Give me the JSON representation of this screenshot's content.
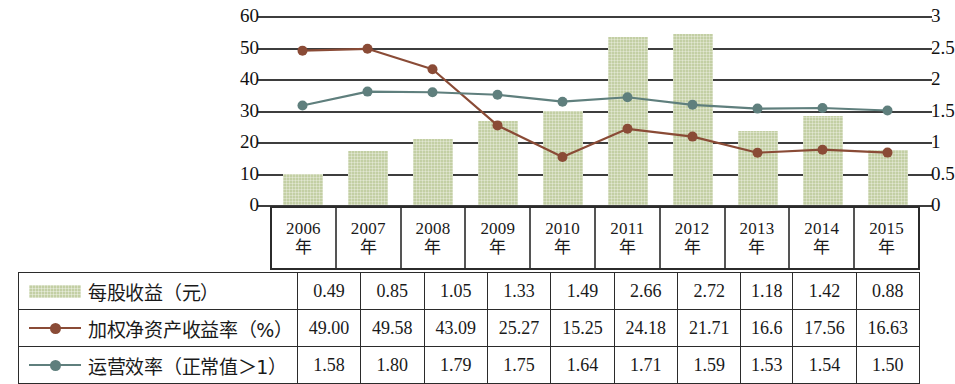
{
  "chart_data": {
    "type": "bar",
    "title": "",
    "subtitle": "",
    "xlabel": "",
    "ylabel": "",
    "grid": true,
    "legend_position": "table-left-column",
    "categories": [
      "2006年",
      "2007年",
      "2008年",
      "2009年",
      "2010年",
      "2011年",
      "2012年",
      "2013年",
      "2014年",
      "2015年"
    ],
    "category_years": [
      "2006",
      "2007",
      "2008",
      "2009",
      "2010",
      "2011",
      "2012",
      "2013",
      "2014",
      "2015"
    ],
    "category_suffix": "年",
    "left_axis": {
      "label": "",
      "ylim": [
        0,
        60
      ],
      "ticks": [
        0,
        10,
        20,
        30,
        40,
        50,
        60
      ],
      "tick_labels": [
        "0",
        "10",
        "20",
        "30",
        "40",
        "50",
        "60"
      ]
    },
    "right_axis": {
      "label": "",
      "ylim": [
        0,
        3
      ],
      "ticks": [
        0,
        0.5,
        1,
        1.5,
        2,
        2.5,
        3
      ],
      "tick_labels": [
        "0",
        "0.5",
        "1",
        "1.5",
        "2",
        "2.5",
        "3"
      ]
    },
    "series": [
      {
        "name": "每股收益（元）",
        "kind": "bar",
        "axis": "right",
        "color": "#c3cfa4",
        "values": [
          0.49,
          0.85,
          1.05,
          1.33,
          1.49,
          2.66,
          2.72,
          1.18,
          1.42,
          0.88
        ],
        "value_labels": [
          "0.49",
          "0.85",
          "1.05",
          "1.33",
          "1.49",
          "2.66",
          "2.72",
          "1.18",
          "1.42",
          "0.88"
        ]
      },
      {
        "name": "加权净资产收益率（%）",
        "kind": "line",
        "axis": "left",
        "color": "#8a4b36",
        "values": [
          49.0,
          49.58,
          43.09,
          25.27,
          15.25,
          24.18,
          21.71,
          16.6,
          17.56,
          16.63
        ],
        "value_labels": [
          "49.00",
          "49.58",
          "43.09",
          "25.27",
          "15.25",
          "24.18",
          "21.71",
          "16.6",
          "17.56",
          "16.63"
        ]
      },
      {
        "name": "运营效率（正常值＞1）",
        "kind": "line",
        "axis": "right",
        "color": "#5f7f7d",
        "values": [
          1.58,
          1.8,
          1.79,
          1.75,
          1.64,
          1.71,
          1.59,
          1.53,
          1.54,
          1.5
        ],
        "value_labels": [
          "1.58",
          "1.80",
          "1.79",
          "1.75",
          "1.64",
          "1.71",
          "1.59",
          "1.53",
          "1.54",
          "1.50"
        ]
      }
    ]
  },
  "table": {
    "rows": [
      {
        "legend_type": "bar",
        "label": "每股收益（元）",
        "values": [
          "0.49",
          "0.85",
          "1.05",
          "1.33",
          "1.49",
          "2.66",
          "2.72",
          "1.18",
          "1.42",
          "0.88"
        ]
      },
      {
        "legend_type": "line-roe",
        "label": "加权净资产收益率（%）",
        "values": [
          "49.00",
          "49.58",
          "43.09",
          "25.27",
          "15.25",
          "24.18",
          "21.71",
          "16.6",
          "17.56",
          "16.63"
        ]
      },
      {
        "legend_type": "line-oe",
        "label": "运营效率（正常值＞1）",
        "values": [
          "1.58",
          "1.80",
          "1.79",
          "1.75",
          "1.64",
          "1.71",
          "1.59",
          "1.53",
          "1.54",
          "1.50"
        ]
      }
    ]
  },
  "colors": {
    "bar_fill": "#c3cfa4",
    "roe_line": "#8a4b36",
    "oe_line": "#5f7f7d",
    "gridline": "#3d3d3d",
    "table_border": "#2b2b2b"
  }
}
